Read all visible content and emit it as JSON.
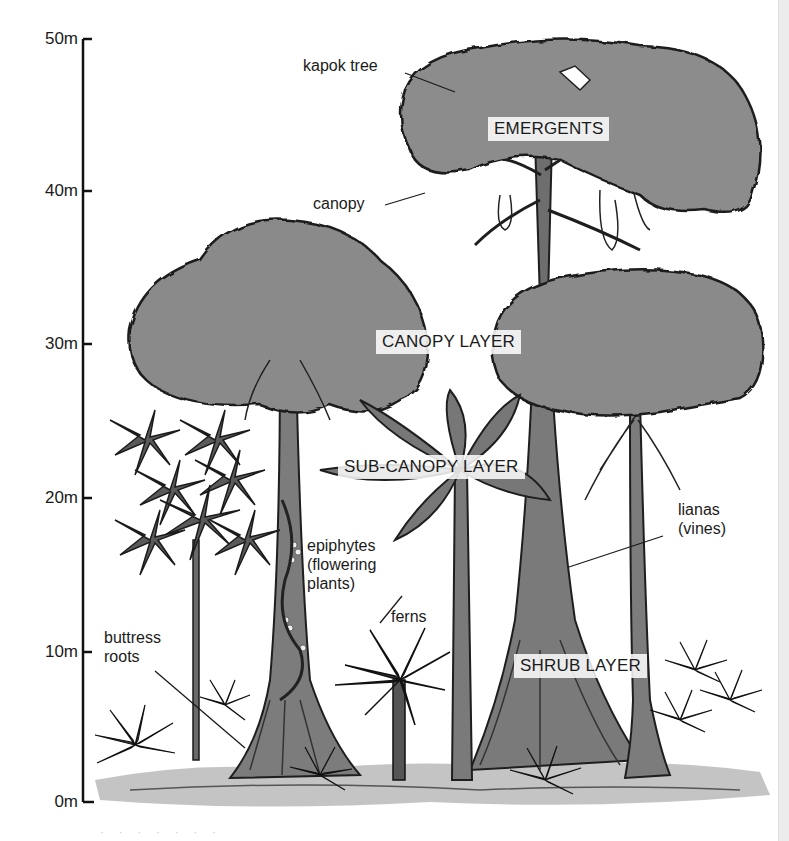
{
  "diagram": {
    "type": "rainforest-layers-illustration",
    "scale": {
      "unit": "m",
      "ticks": [
        {
          "label": "50m",
          "value": 50,
          "y": 39
        },
        {
          "label": "40m",
          "value": 40,
          "y": 191
        },
        {
          "label": "30m",
          "value": 30,
          "y": 344
        },
        {
          "label": "20m",
          "value": 20,
          "y": 498
        },
        {
          "label": "10m",
          "value": 10,
          "y": 652
        },
        {
          "label": "0m",
          "value": 0,
          "y": 802
        }
      ]
    },
    "layers": [
      {
        "id": "emergents",
        "label": "EMERGENTS"
      },
      {
        "id": "canopy",
        "label": "CANOPY LAYER"
      },
      {
        "id": "sub-canopy",
        "label": "SUB-CANOPY LAYER"
      },
      {
        "id": "shrub",
        "label": "SHRUB LAYER"
      }
    ],
    "callouts": [
      {
        "id": "kapok-tree",
        "lines": [
          "kapok tree"
        ]
      },
      {
        "id": "canopy",
        "lines": [
          "canopy"
        ]
      },
      {
        "id": "epiphytes",
        "lines": [
          "epiphytes",
          "(flowering",
          "plants)"
        ]
      },
      {
        "id": "ferns",
        "lines": [
          "ferns"
        ]
      },
      {
        "id": "buttress-roots",
        "lines": [
          "buttress",
          "roots"
        ]
      },
      {
        "id": "lianas",
        "lines": [
          "lianas",
          "(vines)"
        ]
      }
    ],
    "caption": "· · · · · · ·",
    "colors": {
      "foliage": "#8a8a8a",
      "foliage_dark": "#5e5e5e",
      "outline": "#1e1e1e",
      "trunk": "#7a7a7a",
      "ground": "#b0b0b0",
      "background": "#ffffff"
    }
  }
}
